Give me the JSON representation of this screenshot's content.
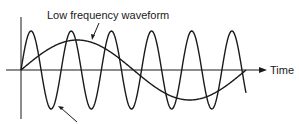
{
  "diagram": {
    "labels": {
      "low_frequency": "Low frequency waveform",
      "x_axis": "Time"
    },
    "colors": {
      "stroke": "#1a1a1a",
      "background": "#ffffff"
    },
    "waves": {
      "high_frequency": {
        "cycles": 5.6,
        "amplitude_px": 39
      },
      "low_frequency": {
        "cycles": 1,
        "amplitude_px": 30
      }
    }
  }
}
